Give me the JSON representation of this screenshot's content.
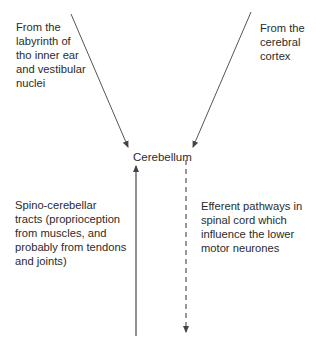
{
  "diagram": {
    "nodes": {
      "labyrinth": "From the\nlabyrinth of\ntho inner ear\nand vestibular\nnuclei",
      "cortex": "From the\ncerebral\ncortex",
      "cerebellum": "Cerebellum",
      "spino": "Spino-cerebellar\ntracts (proprioception\nfrom muscles, and\nprobably from tendons\nand joints)",
      "efferent": "Efferent pathways in\nspinal cord which\ninfluence the lower\nmotor neurones"
    },
    "edges": [
      {
        "from": "labyrinth",
        "to": "cerebellum",
        "style": "solid"
      },
      {
        "from": "cortex",
        "to": "cerebellum",
        "style": "solid"
      },
      {
        "from": "spino",
        "to": "cerebellum",
        "style": "solid"
      },
      {
        "from": "cerebellum",
        "to": "efferent",
        "style": "dashed"
      }
    ],
    "colors": {
      "line": "#555555",
      "text": "#2b2b2b"
    }
  }
}
